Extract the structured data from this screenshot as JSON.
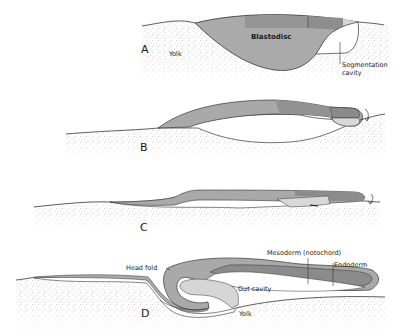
{
  "figure": {
    "panels": [
      {
        "id": "A",
        "letter": "A",
        "labels": {
          "blastodisc": "Blastodisc",
          "yolk": "Yolk",
          "segmentation_cavity_line1": "Segmentation",
          "segmentation_cavity_line2": "cavity"
        }
      },
      {
        "id": "B",
        "letter": "B"
      },
      {
        "id": "C",
        "letter": "C"
      },
      {
        "id": "D",
        "letter": "D",
        "labels": {
          "head_fold": "Head fold",
          "mesoderm": "Mesoderm (notochord)",
          "endoderm": "Endoderm",
          "gut_cavity": "Gut cavity",
          "yolk": "Yolk"
        }
      }
    ]
  },
  "colors": {
    "yolk_stipple": "#c9c9c9",
    "tissue_mid": "#a9a9a9",
    "tissue_dark": "#8c8c8c",
    "tissue_light": "#d4d4d4",
    "outline": "#333333"
  }
}
